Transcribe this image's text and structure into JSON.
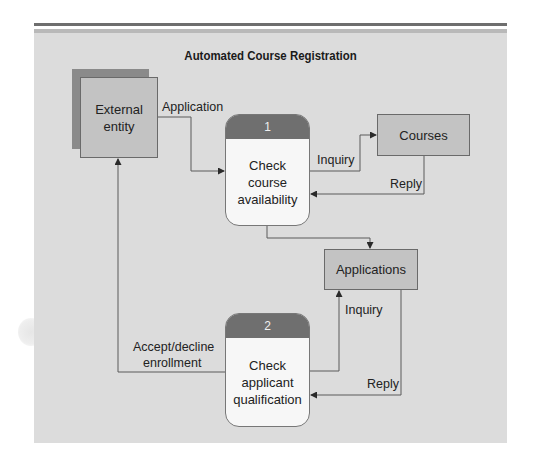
{
  "title": "Automated Course Registration",
  "external_entity": {
    "line1": "External",
    "line2": "entity"
  },
  "processes": [
    {
      "number": "1",
      "line1": "Check",
      "line2": "course",
      "line3": "availability"
    },
    {
      "number": "2",
      "line1": "Check",
      "line2": "applicant",
      "line3": "qualification"
    }
  ],
  "data_stores": {
    "courses": "Courses",
    "applications": "Applications"
  },
  "flows": {
    "application": "Application",
    "inquiry_courses": "Inquiry",
    "reply_courses": "Reply",
    "inquiry_applications": "Inquiry",
    "reply_applications": "Reply",
    "accept_decline_line1": "Accept/decline",
    "accept_decline_line2": "enrollment"
  },
  "colors": {
    "panel": "#dcdcdc",
    "box_fill": "#c3c3c3",
    "entity_shadow": "#8a8a8a",
    "process_header": "#6f6f6f",
    "process_body": "#f7f7f7",
    "line": "#5a5a5a"
  }
}
